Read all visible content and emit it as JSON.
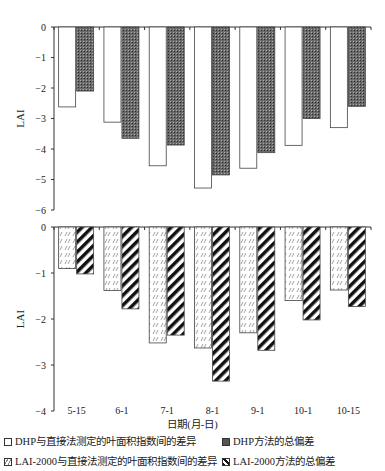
{
  "chart_data": [
    {
      "type": "bar",
      "panel": "top",
      "ylabel": "LAI",
      "ylim": [
        -6,
        0
      ],
      "yticks": [
        0,
        -1,
        -2,
        -3,
        -4,
        -5,
        -6
      ],
      "grid": false,
      "categories": [
        "5-15",
        "6-1",
        "7-1",
        "8-1",
        "9-1",
        "10-1",
        "10-15"
      ],
      "series": [
        {
          "name": "DHP与直接法测定的叶面积指数间的差异",
          "values": [
            -2.62,
            -3.12,
            -4.55,
            -5.28,
            -4.63,
            -3.88,
            -3.3
          ]
        },
        {
          "name": "DHP方法的总偏差",
          "values": [
            -2.1,
            -3.65,
            -3.87,
            -4.85,
            -4.12,
            -3.0,
            -2.6
          ]
        }
      ]
    },
    {
      "type": "bar",
      "panel": "bottom",
      "ylabel": "LAI",
      "xlabel": "日期(月-日)",
      "ylim": [
        -4,
        0
      ],
      "yticks": [
        0,
        -1,
        -2,
        -3,
        -4
      ],
      "grid": false,
      "categories": [
        "5-15",
        "6-1",
        "7-1",
        "8-1",
        "9-1",
        "10-1",
        "10-15"
      ],
      "series": [
        {
          "name": "LAI-2000与直接法测定的叶面积指数间的差异",
          "values": [
            -0.9,
            -1.38,
            -2.52,
            -2.63,
            -2.3,
            -1.6,
            -1.37
          ]
        },
        {
          "name": "LAI-2000方法的总偏差",
          "values": [
            -1.02,
            -1.78,
            -2.35,
            -3.35,
            -2.68,
            -2.02,
            -1.73
          ]
        }
      ]
    }
  ],
  "axes": {
    "top_ylabel": "LAI",
    "bottom_ylabel": "LAI",
    "xlabel": "日期(月-日)"
  },
  "legend": [
    {
      "label": "DHP与直接法测定的叶面积指数间的差异",
      "pattern": "white"
    },
    {
      "label": "DHP方法的总偏差",
      "pattern": "dark-dots"
    },
    {
      "label": "LAI-2000与直接法测定的叶面积指数间的差异",
      "pattern": "light-hatch"
    },
    {
      "label": "LAI-2000方法的总偏差",
      "pattern": "bold-diagonal"
    }
  ]
}
